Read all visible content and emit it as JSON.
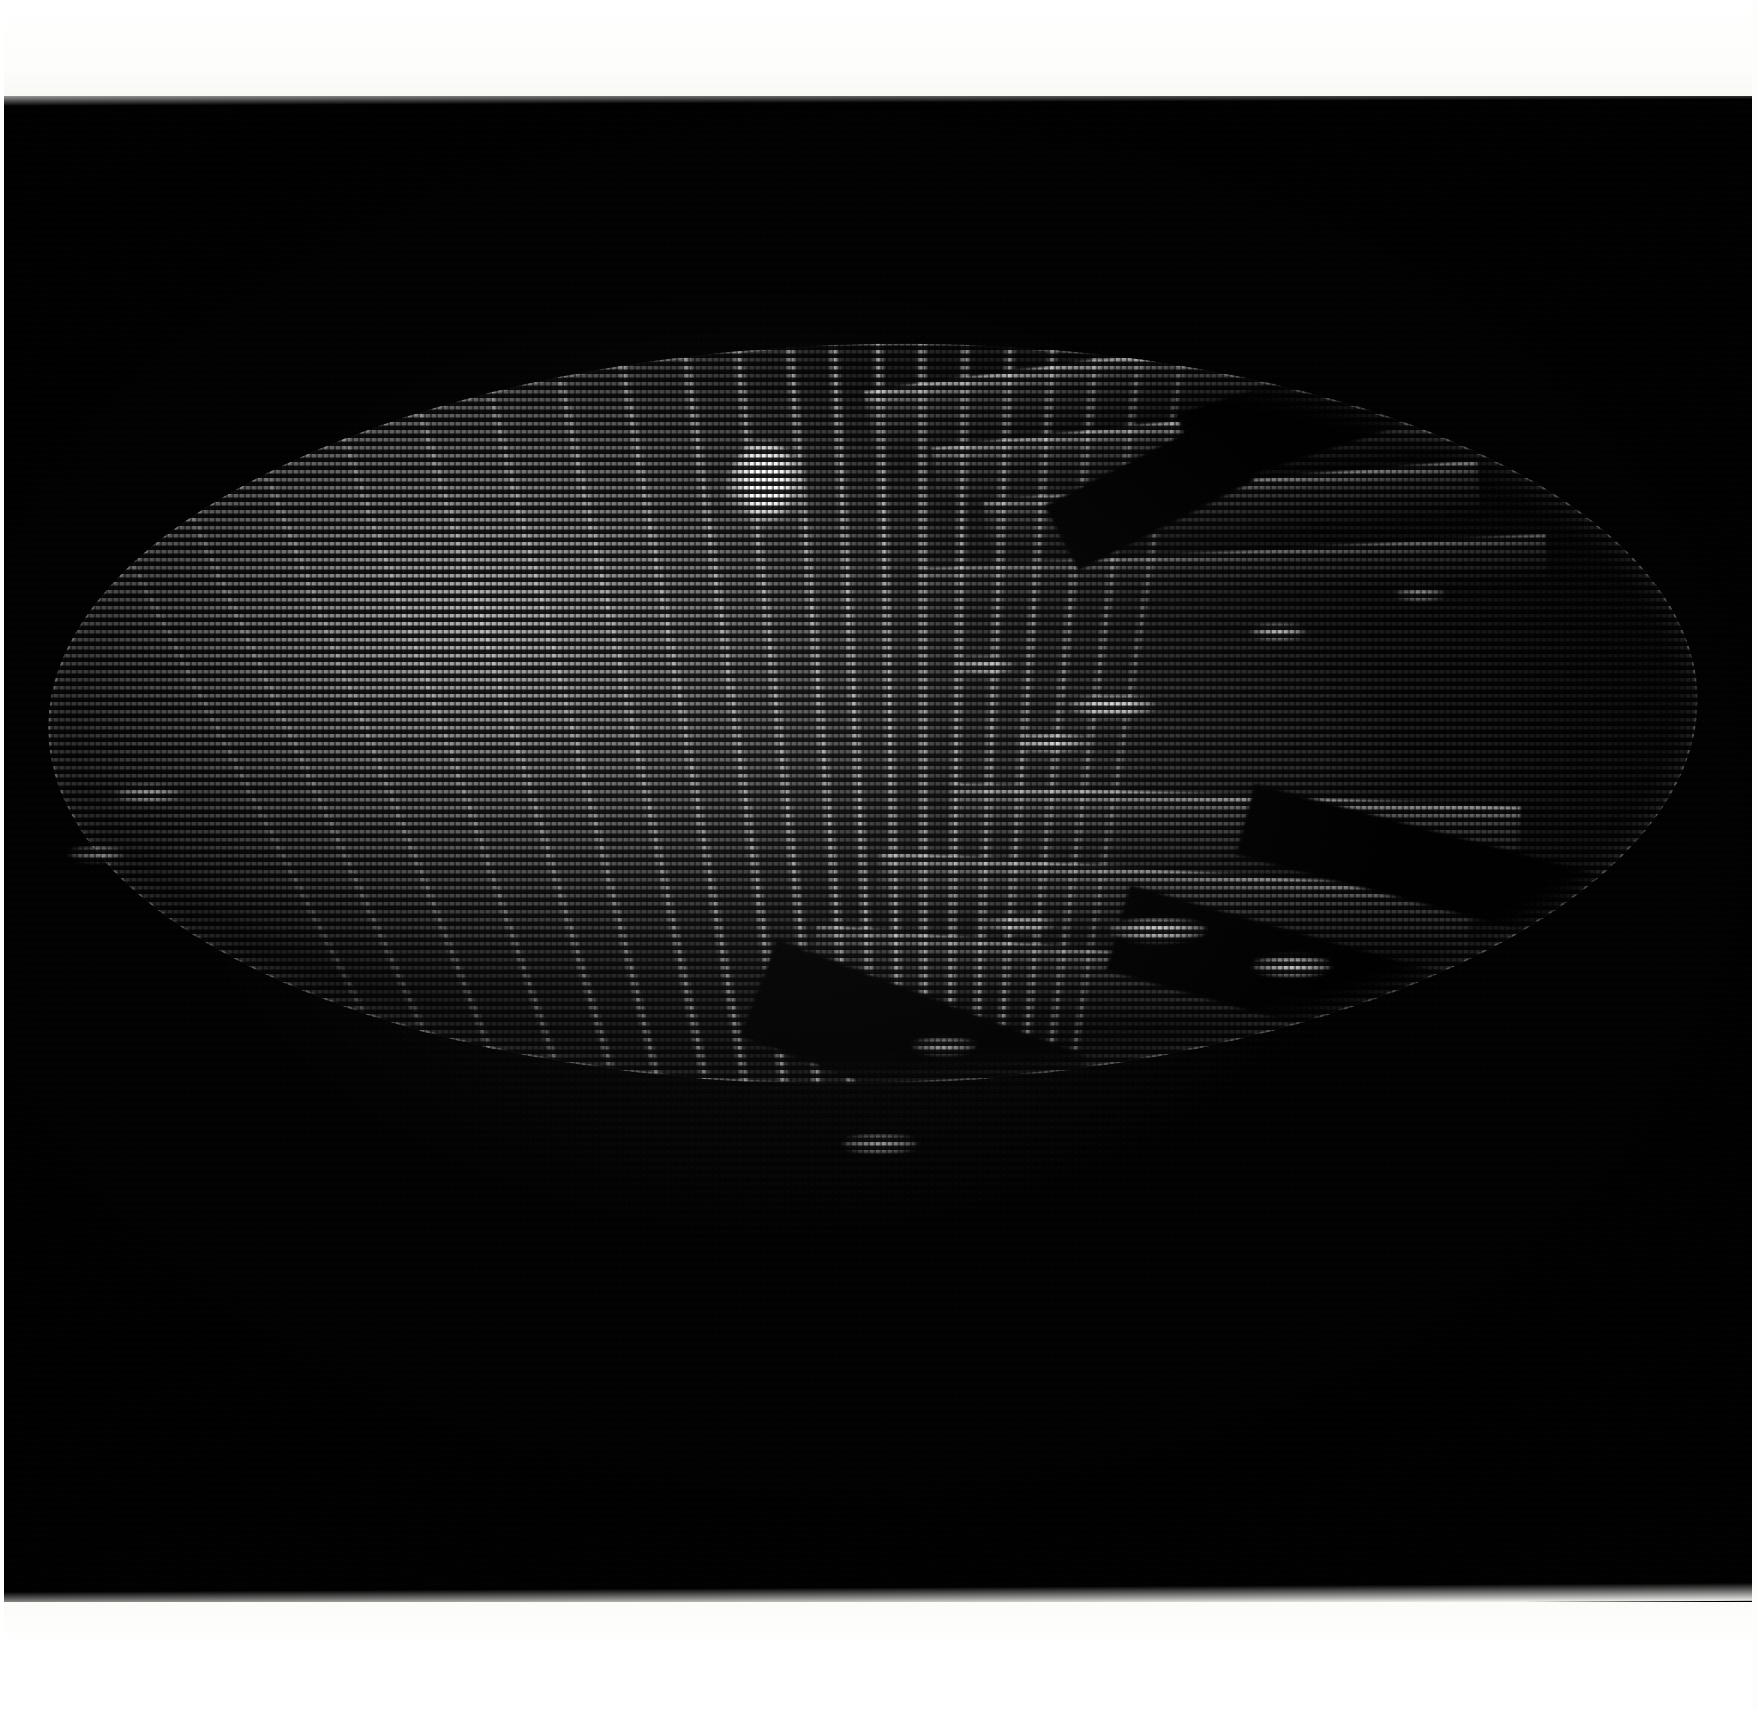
{
  "image": {
    "kind": "photograph-of-crt-display",
    "subject": "3D shaded surface rendering on a raster CRT screen",
    "width_px": 1758,
    "height_px": 1710,
    "orientation": "landscape"
  },
  "frame": {
    "paper_color": "#ffffff",
    "screen_color": "#010101",
    "top_margin_px": 96,
    "bottom_margin_px": 108,
    "screen_top_px": 94,
    "screen_height_px": 1512
  },
  "display": {
    "render_style": "horizontal scanline dot-matrix raster",
    "scanline_pitch_px": 8,
    "dot_pitch_px": 6,
    "phosphor_color": "#e8e8e8",
    "background_color": "#010101",
    "peak_highlight_color": "#ffffff"
  },
  "object": {
    "name": "shaded-sphere-surface",
    "shape": "ellipse",
    "center_x_px": 873,
    "center_y_px": 764,
    "radius_x_px": 825,
    "radius_y_px": 370,
    "tilt_deg": -1.2,
    "features": [
      "specular-highlight-peak",
      "meridional-ridge-family",
      "latitude-shelf-bands",
      "occluded-dark-wedges",
      "bright-rim-silhouette"
    ]
  },
  "specular": {
    "label": "specular-highlight",
    "center_x_px": 765,
    "center_y_px": 409,
    "width_px": 86,
    "height_px": 122,
    "peak_luminance": 255
  },
  "chart_data": {
    "type": "heatmap",
    "title": "",
    "xlabel": "",
    "ylabel": "",
    "legend": [],
    "grid": false,
    "xlim": [
      0,
      1758
    ],
    "ylim": [
      0,
      1512
    ],
    "meridians": [
      {
        "x_pct": 20.0,
        "rotate_deg": -20.0,
        "intensity": 0.42
      },
      {
        "x_pct": 24.5,
        "rotate_deg": -17.5,
        "intensity": 0.48
      },
      {
        "x_pct": 28.5,
        "rotate_deg": -15.0,
        "intensity": 0.55
      },
      {
        "x_pct": 32.0,
        "rotate_deg": -12.5,
        "intensity": 0.6
      },
      {
        "x_pct": 35.5,
        "rotate_deg": -10.5,
        "intensity": 0.66
      },
      {
        "x_pct": 38.5,
        "rotate_deg": -8.5,
        "intensity": 0.72
      },
      {
        "x_pct": 41.5,
        "rotate_deg": -6.5,
        "intensity": 0.78
      },
      {
        "x_pct": 44.0,
        "rotate_deg": -5.0,
        "intensity": 0.82
      },
      {
        "x_pct": 46.5,
        "rotate_deg": -3.5,
        "intensity": 0.86
      },
      {
        "x_pct": 48.5,
        "rotate_deg": -2.0,
        "intensity": 0.9
      },
      {
        "x_pct": 50.5,
        "rotate_deg": -0.5,
        "intensity": 0.92
      },
      {
        "x_pct": 52.5,
        "rotate_deg": 1.0,
        "intensity": 0.9
      },
      {
        "x_pct": 54.5,
        "rotate_deg": 2.5,
        "intensity": 0.86
      },
      {
        "x_pct": 56.5,
        "rotate_deg": 4.0,
        "intensity": 0.8
      },
      {
        "x_pct": 58.5,
        "rotate_deg": 5.5,
        "intensity": 0.74
      },
      {
        "x_pct": 60.5,
        "rotate_deg": 7.0,
        "intensity": 0.66
      },
      {
        "x_pct": 62.5,
        "rotate_deg": 8.5,
        "intensity": 0.58
      },
      {
        "x_pct": 15.5,
        "rotate_deg": -23.0,
        "intensity": 0.36
      },
      {
        "x_pct": 11.5,
        "rotate_deg": -26.0,
        "intensity": 0.3
      },
      {
        "x_pct": 64.5,
        "rotate_deg": 10.0,
        "intensity": 0.48
      }
    ],
    "shelves": [
      {
        "left_pct": 50.0,
        "top_pct": 2.0,
        "w_pct": 34.0,
        "h_pct": 9.0,
        "rot_deg": -6.5,
        "intensity": 0.8
      },
      {
        "left_pct": 54.0,
        "top_pct": 11.0,
        "w_pct": 33.0,
        "h_pct": 8.0,
        "rot_deg": -5.0,
        "intensity": 0.72
      },
      {
        "left_pct": 57.0,
        "top_pct": 19.5,
        "w_pct": 30.0,
        "h_pct": 7.0,
        "rot_deg": -3.5,
        "intensity": 0.62
      },
      {
        "left_pct": 53.0,
        "top_pct": 29.0,
        "w_pct": 38.0,
        "h_pct": 6.0,
        "rot_deg": -2.0,
        "intensity": 0.5
      },
      {
        "left_pct": 55.0,
        "top_pct": 62.0,
        "w_pct": 34.0,
        "h_pct": 8.0,
        "rot_deg": 3.5,
        "intensity": 0.7
      },
      {
        "left_pct": 50.0,
        "top_pct": 72.0,
        "w_pct": 36.0,
        "h_pct": 9.0,
        "rot_deg": 5.0,
        "intensity": 0.62
      },
      {
        "left_pct": 46.0,
        "top_pct": 83.0,
        "w_pct": 38.0,
        "h_pct": 9.0,
        "rot_deg": 6.5,
        "intensity": 0.52
      }
    ],
    "wedges": [
      {
        "left_pct": 69.0,
        "top_pct": 3.0,
        "w_pct": 22.0,
        "h_pct": 11.0,
        "rot_deg": -17.0
      },
      {
        "left_pct": 61.0,
        "top_pct": 16.0,
        "w_pct": 12.0,
        "h_pct": 10.0,
        "rot_deg": -26.0
      },
      {
        "left_pct": 72.0,
        "top_pct": 67.0,
        "w_pct": 22.0,
        "h_pct": 10.0,
        "rot_deg": 16.0
      },
      {
        "left_pct": 64.0,
        "top_pct": 82.0,
        "w_pct": 26.0,
        "h_pct": 12.0,
        "rot_deg": 17.0
      },
      {
        "left_pct": 42.0,
        "top_pct": 88.0,
        "w_pct": 20.0,
        "h_pct": 14.0,
        "rot_deg": 22.0
      }
    ],
    "glints": [
      {
        "x_px": 1112,
        "y_px": 612,
        "w_px": 86,
        "h_px": 22,
        "intensity": 0.95
      },
      {
        "x_px": 1052,
        "y_px": 648,
        "w_px": 70,
        "h_px": 20,
        "intensity": 0.85
      },
      {
        "x_px": 1278,
        "y_px": 538,
        "w_px": 54,
        "h_px": 16,
        "intensity": 0.8
      },
      {
        "x_px": 985,
        "y_px": 572,
        "w_px": 58,
        "h_px": 18,
        "intensity": 0.78
      },
      {
        "x_px": 1158,
        "y_px": 836,
        "w_px": 96,
        "h_px": 24,
        "intensity": 0.92
      },
      {
        "x_px": 1292,
        "y_px": 872,
        "w_px": 78,
        "h_px": 22,
        "intensity": 0.88
      },
      {
        "x_px": 1020,
        "y_px": 830,
        "w_px": 70,
        "h_px": 18,
        "intensity": 0.72
      },
      {
        "x_px": 944,
        "y_px": 952,
        "w_px": 62,
        "h_px": 18,
        "intensity": 0.7
      },
      {
        "x_px": 880,
        "y_px": 1050,
        "w_px": 74,
        "h_px": 20,
        "intensity": 0.66
      },
      {
        "x_px": 148,
        "y_px": 700,
        "w_px": 64,
        "h_px": 18,
        "intensity": 0.6
      },
      {
        "x_px": 96,
        "y_px": 760,
        "w_px": 54,
        "h_px": 16,
        "intensity": 0.55
      },
      {
        "x_px": 1420,
        "y_px": 500,
        "w_px": 48,
        "h_px": 14,
        "intensity": 0.62
      }
    ]
  }
}
